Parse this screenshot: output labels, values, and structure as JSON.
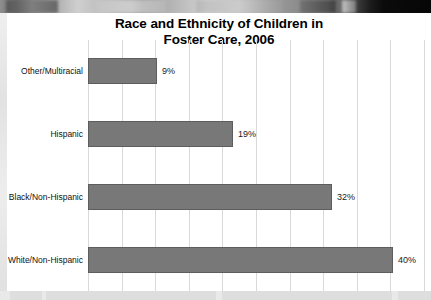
{
  "window": {
    "background_top_band": "photo-strip-grayscale"
  },
  "chart_data": {
    "type": "bar",
    "orientation": "horizontal",
    "title": "Race and Ethnicity of Children in Foster Care, 2006",
    "title_line1": "Race and Ethnicity of Children in",
    "title_line2": "Foster Care, 2006",
    "xlabel": "",
    "ylabel": "",
    "categories": [
      "Other/Multiracial",
      "Hispanic",
      "Black/Non-Hispanic",
      "White/Non-Hispanic"
    ],
    "values": [
      9,
      19,
      32,
      40
    ],
    "value_labels": [
      "9%",
      "19%",
      "32%",
      "40%"
    ],
    "xlim": [
      0,
      44
    ],
    "grid": true,
    "gridline_count": 11,
    "legend": null,
    "bar_color": "#787878",
    "bar_border_color": "#5d5d5d",
    "gridline_color": "#d9d9d9",
    "text_color": "#111111"
  }
}
